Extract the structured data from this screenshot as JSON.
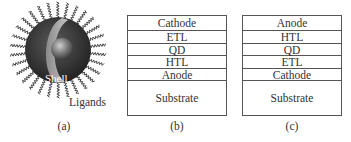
{
  "figure": {
    "panel_a": {
      "caption": "(a)",
      "shell_label": "Shell",
      "ligands_label": "Ligands",
      "colors": {
        "shell_outer": "#3a3a3a",
        "shell_band": "#9a9a9a",
        "core": "#6e6e6e",
        "ligand": "#444444"
      }
    },
    "panel_b": {
      "caption": "(b)",
      "layers": [
        "Cathode",
        "ETL",
        "QD",
        "HTL",
        "Anode",
        "Substrate"
      ]
    },
    "panel_c": {
      "caption": "(c)",
      "layers": [
        "Anode",
        "HTL",
        "QD",
        "ETL",
        "Cathode",
        "Substrate"
      ]
    }
  }
}
